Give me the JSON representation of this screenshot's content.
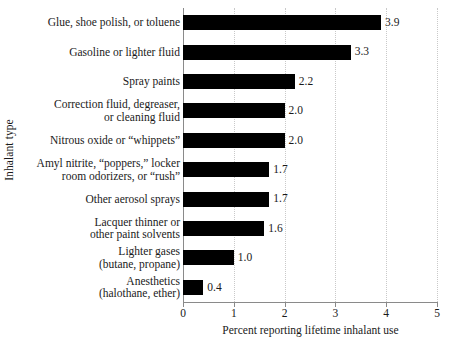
{
  "chart_data": {
    "type": "bar",
    "orientation": "horizontal",
    "title": "",
    "xlabel": "Percent reporting lifetime inhalant use",
    "ylabel": "Inhalant type",
    "xlim": [
      0,
      5
    ],
    "xticks": [
      "0",
      "1",
      "2",
      "3",
      "4",
      "5"
    ],
    "grid": "vertical dotted gridlines at each integer tick",
    "legend": "none",
    "bar_color": "#000000",
    "categories": [
      "Glue, shoe polish, or toluene",
      "Gasoline or lighter fluid",
      "Spray paints",
      "Correction fluid, degreaser,\nor cleaning fluid",
      "Nitrous oxide or “whippets”",
      "Amyl nitrite, “poppers,” locker\nroom odorizers, or “rush”",
      "Other aerosol sprays",
      "Lacquer thinner or\nother paint solvents",
      "Lighter gases\n(butane, propane)",
      "Anesthetics\n(halothane, ether)"
    ],
    "values": [
      3.9,
      3.3,
      2.2,
      2.0,
      2.0,
      1.7,
      1.7,
      1.6,
      1.0,
      0.4
    ],
    "value_labels": [
      "3.9",
      "3.3",
      "2.2",
      "2.0",
      "2.0",
      "1.7",
      "1.7",
      "1.6",
      "1.0",
      "0.4"
    ]
  }
}
